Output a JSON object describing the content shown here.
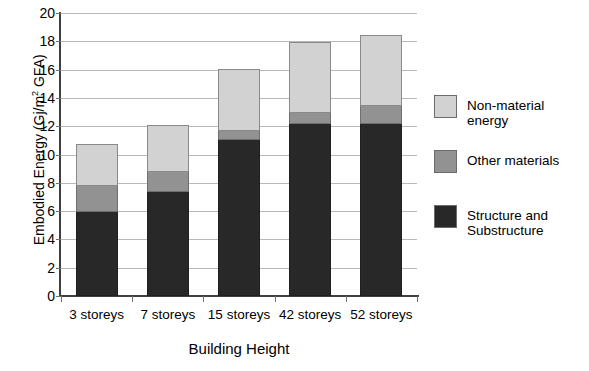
{
  "chart_data": {
    "type": "bar",
    "subtype": "stacked-vertical",
    "title": "",
    "xlabel": "Building Height",
    "ylabel": "Embodied Energy (Gj/m² GFA)",
    "ylabel_prefix": "Embodied Energy (Gj/m",
    "ylabel_sup": "2",
    "ylabel_suffix": " GFA)",
    "categories": [
      "3 storeys",
      "7 storeys",
      "15 storeys",
      "42 storeys",
      "52 storeys"
    ],
    "series": [
      {
        "name": "Structure and Substructure",
        "legend_label": "Structure and\nSubstructure",
        "color": "#282828",
        "values": [
          5.95,
          7.35,
          11.0,
          12.15,
          12.15
        ]
      },
      {
        "name": "Other materials",
        "legend_label": "Other materials",
        "color": "#929292",
        "values": [
          1.85,
          1.4,
          0.65,
          0.75,
          1.25
        ]
      },
      {
        "name": "Non-material energy",
        "legend_label": "Non-material energy",
        "color": "#d2d2d2",
        "values": [
          2.87,
          3.25,
          4.35,
          4.95,
          5.0
        ]
      }
    ],
    "totals": [
      10.67,
      12.0,
      16.0,
      17.85,
      18.4
    ],
    "ylim": [
      0,
      20
    ],
    "ytick_step": 2,
    "yticks": [
      "0",
      "2",
      "4",
      "6",
      "8",
      "10",
      "12",
      "14",
      "16",
      "18",
      "20"
    ],
    "grid": true,
    "grid_axis": "y",
    "legend_position": "right",
    "legend_order": [
      "Non-material energy",
      "Other materials",
      "Structure and\nSubstructure"
    ]
  }
}
